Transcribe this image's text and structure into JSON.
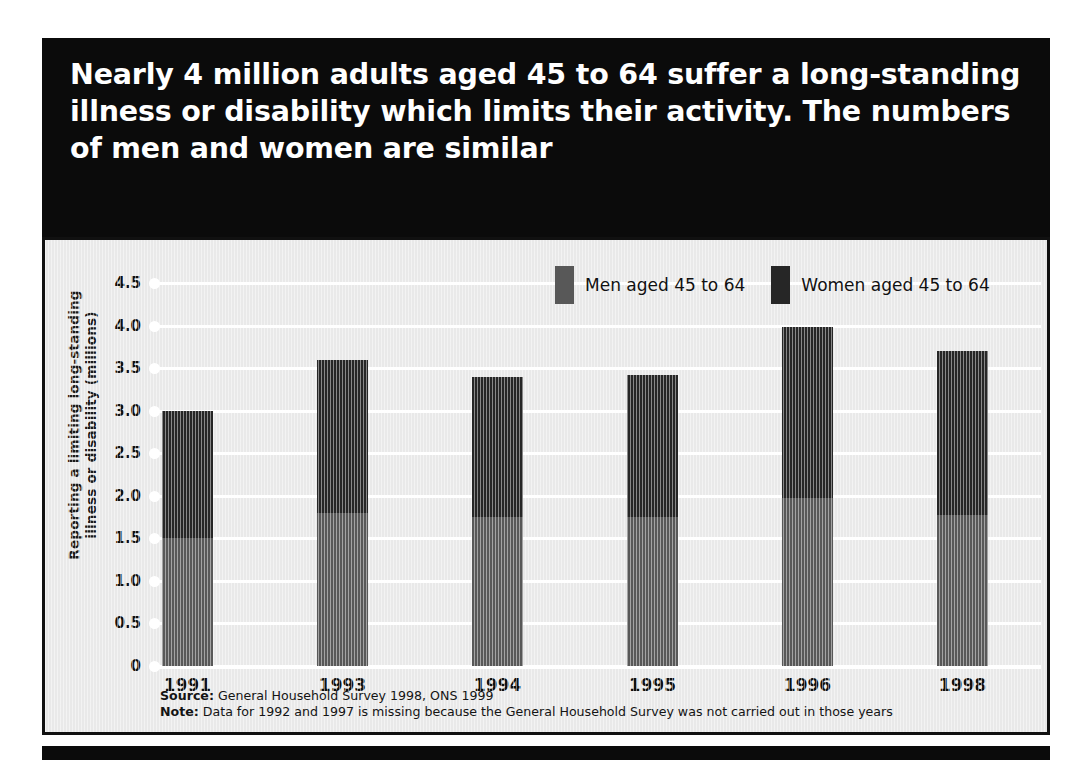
{
  "headline": "Nearly 4 million adults aged 45 to 64 suffer a long-standing illness or disability which limits their activity. The numbers of men and women are similar",
  "legend": {
    "men_label": "Men aged 45 to 64",
    "women_label": "Women aged 45 to 64"
  },
  "footnotes": {
    "source_label": "Source:",
    "source_text": " General Household Survey 1998, ONS 1999",
    "note_label": "Note:",
    "note_text": " Data for 1992 and 1997 is missing because the General Household Survey was not carried out in those years"
  },
  "colors": {
    "headline_background": "#0b0b0b",
    "headline_text": "#ffffff",
    "panel_background": "#e9e9e9",
    "panel_border": "#111111",
    "gridline": "#ffffff",
    "men_bar": "#585858",
    "women_bar": "#262626",
    "axis_text": "#111111"
  },
  "chart_data": {
    "type": "bar",
    "stacked": true,
    "title": "Nearly 4 million adults aged 45 to 64 suffer a long-standing illness or disability which limits their activity. The numbers of men and women are similar",
    "xlabel": "",
    "ylabel": "Reporting a limiting long-standing illness or disability (millions)",
    "ylabel_lines": [
      "Reporting a limiting long-standing",
      "illness or disability (millions)"
    ],
    "categories": [
      "1991",
      "1993",
      "1994",
      "1995",
      "1996",
      "1998"
    ],
    "series": [
      {
        "name": "Men aged 45 to 64",
        "color": "#585858",
        "values": [
          1.5,
          1.8,
          1.75,
          1.75,
          1.97,
          1.78
        ]
      },
      {
        "name": "Women aged 45 to 64",
        "color": "#262626",
        "values": [
          1.5,
          1.8,
          1.65,
          1.67,
          2.01,
          1.92
        ]
      }
    ],
    "totals": [
      3.0,
      3.6,
      3.4,
      3.42,
      3.98,
      3.7
    ],
    "ylim": [
      0,
      4.5
    ],
    "yticks": [
      0,
      0.5,
      1.0,
      1.5,
      2.0,
      2.5,
      3.0,
      3.5,
      4.0,
      4.5
    ],
    "ytick_labels": [
      "0",
      "0.5",
      "1.0",
      "1.5",
      "2.0",
      "2.5",
      "3.0",
      "3.5",
      "4.0",
      "4.5"
    ],
    "grid": true,
    "legend_position": "top-right"
  }
}
